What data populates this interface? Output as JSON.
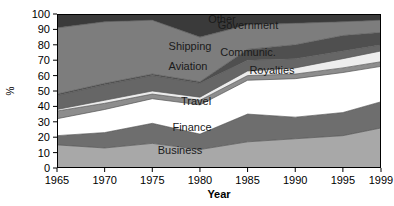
{
  "chart_data": {
    "type": "area",
    "stacked": true,
    "title": "",
    "xlabel": "Year",
    "ylabel": "%",
    "x": [
      1965,
      1970,
      1975,
      1980,
      1985,
      1990,
      1995,
      1999
    ],
    "xtick_labels": [
      "1965",
      "1970",
      "1975",
      "1980",
      "1985",
      "1990",
      "1995",
      "1999"
    ],
    "ytick_labels": [
      "0",
      "10",
      "20",
      "30",
      "40",
      "50",
      "60",
      "70",
      "80",
      "90",
      "100"
    ],
    "ylim": [
      0,
      100
    ],
    "xlim": [
      1965,
      1999
    ],
    "grid": false,
    "legend": "inline-labels",
    "series": [
      {
        "name": "Business",
        "label": "Business",
        "color": "#a8a8a8",
        "values": [
          15,
          13,
          16,
          12,
          17,
          19,
          21,
          26
        ]
      },
      {
        "name": "Finance",
        "label": "Finance",
        "color": "#6e6e6e",
        "values": [
          6,
          10,
          13,
          10,
          18,
          14,
          15,
          17
        ]
      },
      {
        "name": "Travel",
        "label": "Travel",
        "color": "#ffffff",
        "values": [
          11,
          15,
          16,
          19,
          22,
          25,
          26,
          23
        ]
      },
      {
        "name": "Aviation",
        "label": "Aviation",
        "color": "#8d8d8d",
        "values": [
          5,
          4,
          3,
          3,
          3,
          3,
          3,
          3
        ]
      },
      {
        "name": "Royalties",
        "label": "Royalties",
        "color": "#ededed",
        "values": [
          1,
          2,
          2,
          2,
          3,
          4,
          6,
          7
        ]
      },
      {
        "name": "Shipping",
        "label": "Shipping",
        "color": "#666666",
        "values": [
          9,
          10,
          10,
          9,
          7,
          6,
          5,
          4
        ]
      },
      {
        "name": "Communic.",
        "label": "Communic.",
        "color": "#4f4f4f",
        "values": [
          1,
          1,
          1,
          1,
          7,
          9,
          10,
          8
        ]
      },
      {
        "name": "Government",
        "label": "Government",
        "color": "#7d7d7d",
        "values": [
          43,
          40,
          35,
          29,
          16,
          14,
          9,
          8
        ]
      },
      {
        "name": "Other",
        "label": "Other",
        "color": "#3a3a3a",
        "values": [
          9,
          5,
          4,
          15,
          7,
          6,
          5,
          4
        ]
      }
    ],
    "band_labels": [
      {
        "text": "Other",
        "x": 222,
        "y": 23
      },
      {
        "text": "Government",
        "x": 248,
        "y": 29
      },
      {
        "text": "Shipping",
        "x": 190,
        "y": 50
      },
      {
        "text": "Communic.",
        "x": 248,
        "y": 56
      },
      {
        "text": "Aviation",
        "x": 188,
        "y": 70
      },
      {
        "text": "Royalties",
        "x": 272,
        "y": 74
      },
      {
        "text": "Travel",
        "x": 196,
        "y": 105
      },
      {
        "text": "Finance",
        "x": 192,
        "y": 131
      },
      {
        "text": "Business",
        "x": 180,
        "y": 154
      }
    ]
  }
}
